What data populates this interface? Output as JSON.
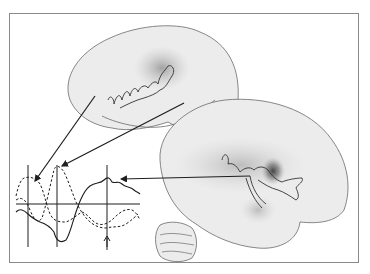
{
  "figure": {
    "colors": {
      "background": "#ffffff",
      "frame": "#8a8a8a",
      "brain_fill": "#ececec",
      "brain_outline": "#6a6a6a",
      "activation_light": "#c8c8c8",
      "activation_mid": "#9a9a9a",
      "activation_dark": "#555555",
      "ink": "#1e1e1e"
    },
    "panels": [
      {
        "name": "upper-brain",
        "view": "lateral hemisphere with traced sulcus outline"
      },
      {
        "name": "lower-brain",
        "view": "lateral hemisphere with cerebellum and dark activation focus"
      }
    ],
    "waveforms": [
      {
        "name": "waveform-1",
        "style": "dashed",
        "peak": "early"
      },
      {
        "name": "waveform-2",
        "style": "dashed",
        "peak": "middle"
      },
      {
        "name": "waveform-3",
        "style": "solid",
        "peak": "late"
      }
    ],
    "markers": {
      "vertical_lines": 3,
      "baseline": true,
      "up_arrow": true
    },
    "arrows": 3
  }
}
